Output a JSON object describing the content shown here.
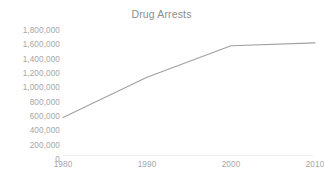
{
  "chart_data": {
    "type": "line",
    "title": "Drug Arrests",
    "xlabel": "",
    "ylabel": "",
    "x": [
      1980,
      1990,
      2000,
      2010
    ],
    "categories": [
      "1980",
      "1990",
      "2000",
      "2010"
    ],
    "values": [
      580000,
      1140000,
      1580000,
      1620000
    ],
    "series": [
      {
        "name": "Drug Arrests",
        "values": [
          580000,
          1140000,
          1580000,
          1620000
        ],
        "color": "#a0a0a0"
      }
    ],
    "xlim": [
      1980,
      2010
    ],
    "ylim": [
      0,
      1800000
    ],
    "y_ticks": [
      0,
      200000,
      400000,
      600000,
      800000,
      1000000,
      1200000,
      1400000,
      1600000,
      1800000
    ],
    "y_tick_labels": [
      "1,800,000",
      "1,600,000",
      "1,400,000",
      "1,200,000",
      "1,000,000",
      "800,000",
      "600,000",
      "400,000",
      "200,000",
      "0"
    ],
    "x_tick_labels": [
      "1980",
      "1990",
      "2000",
      "2010"
    ],
    "grid": false,
    "legend": false,
    "legend_position": "none",
    "line_color": "#a0a0a0",
    "title_color": "#8d8d8d",
    "tick_label_color": "#a6a6a6",
    "axis_line_color": "#efefef",
    "background_color": "#ffffff"
  }
}
